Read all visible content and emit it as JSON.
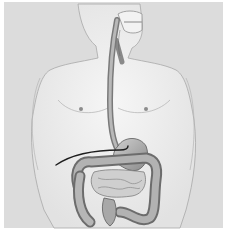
{
  "image": {
    "subject": "digestive-system-illustration",
    "description": "Grayscale anatomical illustration of a male torso showing the digestive tract with a tube inserted through the mouth and esophagus into the stomach",
    "colors": {
      "background": "#dcdcdc",
      "body": "#ececec",
      "outline": "#9a9a9a",
      "organ_light": "#bdbdbd",
      "organ_dark": "#6e6e6e",
      "tube": "#222222"
    }
  }
}
